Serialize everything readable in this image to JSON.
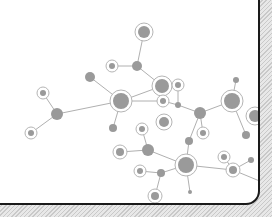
{
  "illustration": {
    "title": "",
    "colors": {
      "card_bg": "#ffffff",
      "border": "#1a1a1a",
      "hatch_light": "#e8e8e8",
      "hatch_dark": "#c9c9c9",
      "node_fill": "#9a9a9a",
      "ring_stroke": "#b5b5b5",
      "edge_stroke": "#b0b0b0"
    },
    "nodes": [
      {
        "id": "A",
        "x": 144,
        "y": 32,
        "r": 6,
        "ring": true
      },
      {
        "id": "B",
        "x": 137,
        "y": 66,
        "r": 5,
        "ring": false
      },
      {
        "id": "C",
        "x": 112,
        "y": 66,
        "r": 3,
        "ring": true
      },
      {
        "id": "D",
        "x": 162,
        "y": 86,
        "r": 7,
        "ring": true
      },
      {
        "id": "E",
        "x": 90,
        "y": 77,
        "r": 5,
        "ring": false
      },
      {
        "id": "F",
        "x": 121,
        "y": 101,
        "r": 8,
        "ring": true
      },
      {
        "id": "G",
        "x": 43,
        "y": 93,
        "r": 3,
        "ring": true
      },
      {
        "id": "H",
        "x": 57,
        "y": 114,
        "r": 6,
        "ring": false
      },
      {
        "id": "I",
        "x": 31,
        "y": 133,
        "r": 3,
        "ring": true
      },
      {
        "id": "J",
        "x": 113,
        "y": 128,
        "r": 4,
        "ring": false
      },
      {
        "id": "K",
        "x": 163,
        "y": 101,
        "r": 3,
        "ring": true
      },
      {
        "id": "L",
        "x": 178,
        "y": 85,
        "r": 3,
        "ring": true
      },
      {
        "id": "M",
        "x": 178,
        "y": 105,
        "r": 3,
        "ring": false
      },
      {
        "id": "N",
        "x": 200,
        "y": 113,
        "r": 6,
        "ring": false
      },
      {
        "id": "O",
        "x": 236,
        "y": 80,
        "r": 3,
        "ring": false
      },
      {
        "id": "P",
        "x": 232,
        "y": 101,
        "r": 8,
        "ring": true
      },
      {
        "id": "Q",
        "x": 246,
        "y": 135,
        "r": 4,
        "ring": false
      },
      {
        "id": "R",
        "x": 255,
        "y": 116,
        "r": 6,
        "ring": true
      },
      {
        "id": "S",
        "x": 164,
        "y": 122,
        "r": 5,
        "ring": true
      },
      {
        "id": "T",
        "x": 142,
        "y": 129,
        "r": 3,
        "ring": true
      },
      {
        "id": "U",
        "x": 203,
        "y": 133,
        "r": 3,
        "ring": true
      },
      {
        "id": "V",
        "x": 148,
        "y": 150,
        "r": 6,
        "ring": false
      },
      {
        "id": "W",
        "x": 120,
        "y": 152,
        "r": 4,
        "ring": true
      },
      {
        "id": "X",
        "x": 186,
        "y": 165,
        "r": 8,
        "ring": true
      },
      {
        "id": "Y",
        "x": 189,
        "y": 141,
        "r": 4,
        "ring": false
      },
      {
        "id": "Z",
        "x": 224,
        "y": 157,
        "r": 3,
        "ring": true
      },
      {
        "id": "AA",
        "x": 233,
        "y": 170,
        "r": 4,
        "ring": true
      },
      {
        "id": "AB",
        "x": 251,
        "y": 160,
        "r": 3,
        "ring": false
      },
      {
        "id": "AC",
        "x": 161,
        "y": 173,
        "r": 4,
        "ring": false
      },
      {
        "id": "AD",
        "x": 140,
        "y": 171,
        "r": 3,
        "ring": true
      },
      {
        "id": "AE",
        "x": 155,
        "y": 196,
        "r": 4,
        "ring": true
      },
      {
        "id": "AF",
        "x": 190,
        "y": 192,
        "r": 2,
        "ring": false
      }
    ],
    "edges": [
      [
        "A",
        "B"
      ],
      [
        "C",
        "B"
      ],
      [
        "B",
        "D"
      ],
      [
        "E",
        "F"
      ],
      [
        "F",
        "D"
      ],
      [
        "F",
        "J"
      ],
      [
        "F",
        "K"
      ],
      [
        "F",
        "H"
      ],
      [
        "G",
        "H"
      ],
      [
        "H",
        "I"
      ],
      [
        "L",
        "M"
      ],
      [
        "M",
        "N"
      ],
      [
        "K",
        "M"
      ],
      [
        "N",
        "P"
      ],
      [
        "O",
        "P"
      ],
      [
        "P",
        "Q"
      ],
      [
        "N",
        "Y"
      ],
      [
        "V",
        "W"
      ],
      [
        "V",
        "T"
      ],
      [
        "V",
        "X"
      ],
      [
        "X",
        "Y"
      ],
      [
        "X",
        "AC"
      ],
      [
        "X",
        "AF"
      ],
      [
        "X",
        "AA"
      ],
      [
        "AA",
        "Z"
      ],
      [
        "AA",
        "AB"
      ],
      [
        "AA",
        "R2"
      ],
      [
        "AC",
        "AD"
      ],
      [
        "AC",
        "AE"
      ],
      [
        "U",
        "N"
      ]
    ],
    "extra_points": {
      "R2": {
        "x": 262,
        "y": 182
      }
    }
  }
}
